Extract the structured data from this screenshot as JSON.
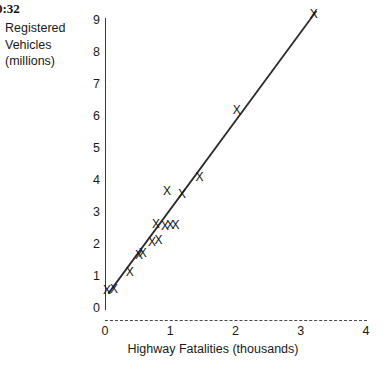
{
  "overlay": {
    "timestamp": "0:32"
  },
  "chart_data": {
    "type": "scatter",
    "title": "",
    "xlabel": "Highway Fatalities (thousands)",
    "ylabel": "Registered Vehicles (millions)",
    "ylabel_lines": [
      "Registered",
      "Vehicles",
      "(millions)"
    ],
    "xlim": [
      0,
      4
    ],
    "ylim": [
      0,
      9
    ],
    "xticks": [
      0,
      1,
      2,
      3,
      4
    ],
    "yticks": [
      0,
      1,
      2,
      3,
      4,
      5,
      6,
      7,
      8,
      9
    ],
    "xtick_labels": [
      "0",
      "1",
      "2",
      "3",
      "4"
    ],
    "ytick_labels": [
      "0",
      "1",
      "2",
      "3",
      "4",
      "5",
      "6",
      "7",
      "8",
      "9"
    ],
    "grid": false,
    "legend": null,
    "marker_symbol": "X",
    "x_axis_style": "dashed",
    "y_axis_style": "solid",
    "points": [
      {
        "x": 0.03,
        "y": 0.52
      },
      {
        "x": 0.14,
        "y": 0.55
      },
      {
        "x": 0.38,
        "y": 1.08
      },
      {
        "x": 0.52,
        "y": 1.62
      },
      {
        "x": 0.58,
        "y": 1.7
      },
      {
        "x": 0.72,
        "y": 2.04
      },
      {
        "x": 0.82,
        "y": 2.08
      },
      {
        "x": 0.78,
        "y": 2.6
      },
      {
        "x": 0.92,
        "y": 2.52
      },
      {
        "x": 1.0,
        "y": 2.55
      },
      {
        "x": 1.08,
        "y": 2.55
      },
      {
        "x": 0.95,
        "y": 3.62
      },
      {
        "x": 1.18,
        "y": 3.52
      },
      {
        "x": 1.45,
        "y": 4.05
      },
      {
        "x": 2.02,
        "y": 6.15
      },
      {
        "x": 3.2,
        "y": 9.15
      }
    ],
    "trendline": {
      "visible": true,
      "x_start": 0.05,
      "y_start": 0.45,
      "x_end": 3.24,
      "y_end": 9.28
    }
  }
}
